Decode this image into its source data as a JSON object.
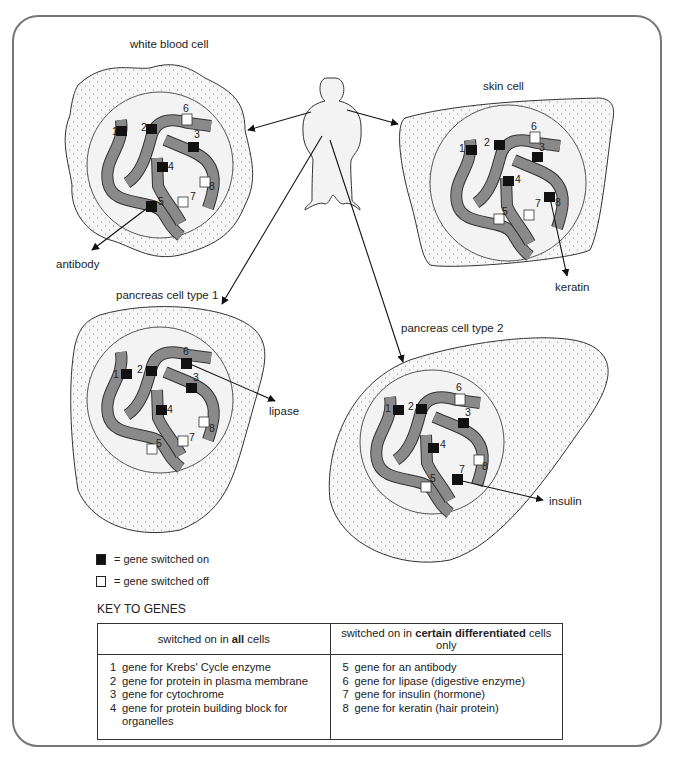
{
  "diagram": {
    "human_label": "human body",
    "cells": [
      {
        "id": "wbc",
        "title": "white blood cell",
        "product": "antibody",
        "on": [
          1,
          2,
          3,
          4,
          5
        ],
        "off": [
          6,
          7,
          8
        ]
      },
      {
        "id": "skin",
        "title": "skin cell",
        "product": "keratin",
        "on": [
          1,
          2,
          3,
          4,
          8
        ],
        "off": [
          5,
          6,
          7
        ]
      },
      {
        "id": "panc1",
        "title": "pancreas cell type 1",
        "product": "lipase",
        "on": [
          1,
          2,
          3,
          4,
          6
        ],
        "off": [
          5,
          7,
          8
        ]
      },
      {
        "id": "panc2",
        "title": "pancreas cell type 2",
        "product": "insulin",
        "on": [
          1,
          2,
          3,
          4,
          7
        ],
        "off": [
          5,
          6,
          8
        ]
      }
    ]
  },
  "legend": {
    "on_label": "= gene switched on",
    "off_label": "= gene switched off"
  },
  "key": {
    "title": "KEY TO GENES",
    "col1_header_pre": "switched on in ",
    "col1_header_bold": "all",
    "col1_header_post": " cells",
    "col2_header_pre": "switched on in ",
    "col2_header_bold": "certain differentiated",
    "col2_header_post": " cells only",
    "col1": [
      {
        "n": "1",
        "text": "gene for Krebs' Cycle enzyme"
      },
      {
        "n": "2",
        "text": "gene for protein in plasma membrane"
      },
      {
        "n": "3",
        "text": "gene for cytochrome"
      },
      {
        "n": "4",
        "text": "gene for protein building block for organelles"
      }
    ],
    "col2": [
      {
        "n": "5",
        "text": "gene for an antibody"
      },
      {
        "n": "6",
        "text": "gene for lipase (digestive enzyme)"
      },
      {
        "n": "7",
        "text": "gene for insulin (hormone)"
      },
      {
        "n": "8",
        "text": "gene for keratin (hair protein)"
      }
    ]
  },
  "colors": {
    "chromosome": "#8a8a8a",
    "gene_on": "#111111",
    "gene_off": "#ffffff",
    "cytoplasm": "#f4f4f4",
    "nucleus": "#f2f2f2",
    "outline": "#333333"
  }
}
